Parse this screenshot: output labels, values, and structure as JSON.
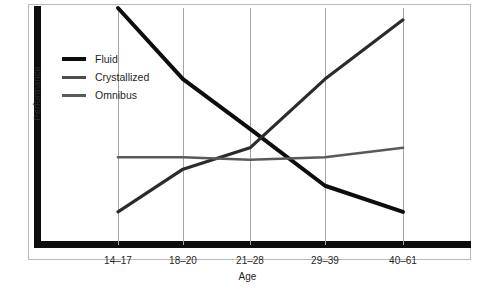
{
  "chart_data": {
    "type": "line",
    "title": "",
    "xlabel": "Age",
    "ylabel": "Performance",
    "categories": [
      "14–17",
      "18–20",
      "21–28",
      "29–39",
      "40–61"
    ],
    "ylim": [
      0,
      100
    ],
    "grid": "vertical-only",
    "legend_position": "upper-left-inside",
    "series": [
      {
        "name": "Fluid",
        "values": [
          100,
          70,
          49,
          25,
          14
        ],
        "color": "#0d0d0d",
        "width": 4
      },
      {
        "name": "Crystallized",
        "values": [
          14,
          32,
          41,
          70,
          95
        ],
        "color": "#2b2b2b",
        "width": 3.2
      },
      {
        "name": "Omnibus",
        "values": [
          37,
          37,
          36,
          37,
          41
        ],
        "color": "#5a5a5a",
        "width": 2.6
      }
    ]
  },
  "legend": {
    "items": [
      {
        "label": "Fluid"
      },
      {
        "label": "Crystallized"
      },
      {
        "label": "Omnibus"
      }
    ]
  },
  "axes": {
    "y_title": "Performance",
    "x_title": "Age",
    "x_ticks": [
      "14–17",
      "18–20",
      "21–28",
      "29–39",
      "40–61"
    ]
  }
}
